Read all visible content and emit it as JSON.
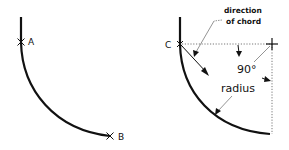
{
  "figure_left": {
    "point_a_label": "A",
    "point_b_label": "B"
  },
  "figure_right": {
    "point_c_label": "C",
    "annotation_chord_line1": "direction",
    "annotation_chord_line2": "of chord",
    "angle_label": "90°",
    "radius_label": "radius",
    "center_mark": "+"
  },
  "colors": {
    "stroke": "#111111",
    "dotted": "#555555",
    "background": "#ffffff"
  }
}
